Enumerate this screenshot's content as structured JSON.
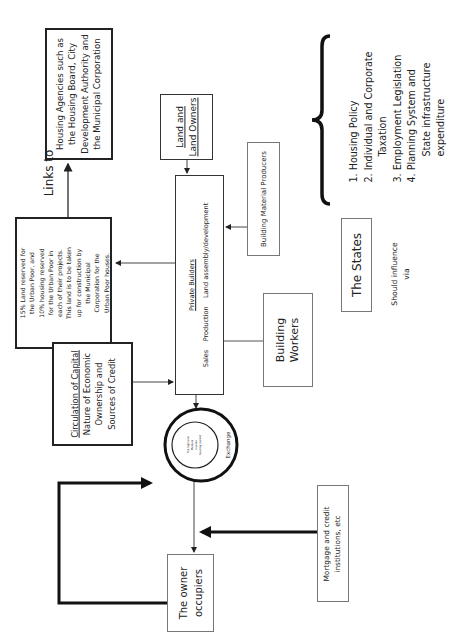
{
  "diagram": {
    "orientation": "rotated 90° counter-clockwise",
    "nodes": {
      "housing_agencies": {
        "lines": [
          "Housing Agencies such as",
          "the Housing Board, City",
          "Development Authority and",
          "the Municipal Corporation"
        ]
      },
      "links_to": {
        "label": "Links to"
      },
      "land_reservation": {
        "lines": [
          "15% Land reserved for",
          "the Urban Poor, and",
          "10% housing reserved",
          "for the Urban Poor in",
          "each of their projects.",
          "This land is to be taken",
          "up for construction by",
          "the Municipal",
          "Corporation for the",
          "Urban Poor houses."
        ]
      },
      "circulation_of_capital": {
        "title": "Circulation of Capital",
        "lines": [
          "Nature of Economic",
          "Ownership and",
          "Sources of Credit"
        ]
      },
      "land_owners": {
        "lines": [
          "Land and",
          "Land Owners"
        ]
      },
      "private_builders": {
        "title": "Private Builders",
        "activities": "Sales    Production    Land assembly/development"
      },
      "building_material_producers": {
        "label": "Building Material Producers"
      },
      "building_workers": {
        "lines": [
          "Building",
          "Workers"
        ]
      },
      "exchange": {
        "outer_label": "Exchange",
        "inner_lines": [
          "The high and",
          "Medium",
          "Income",
          "housing market"
        ]
      },
      "owner_occupiers": {
        "lines": [
          "The owner",
          "occupiers"
        ]
      },
      "mortgage": {
        "lines": [
          "Mortgage and credit",
          "institutions, etc"
        ]
      },
      "the_states": {
        "label": "The States"
      },
      "should_influence": {
        "lines": [
          "Should influence",
          "via"
        ]
      },
      "policy_list": {
        "items": [
          {
            "text": "1. Housing Policy",
            "indent": false
          },
          {
            "text": "2. Individual and Corporate",
            "indent": false
          },
          {
            "text": "Taxation",
            "indent": true
          },
          {
            "text": "3. Employment Legislation",
            "indent": false
          },
          {
            "text": "4. Planning System and",
            "indent": false
          },
          {
            "text": "State infrastructure",
            "indent": true
          },
          {
            "text": "expenditure",
            "indent": true
          }
        ]
      }
    },
    "colors": {
      "line": "#222222",
      "thin_border": "#777777",
      "background": "#ffffff"
    }
  }
}
